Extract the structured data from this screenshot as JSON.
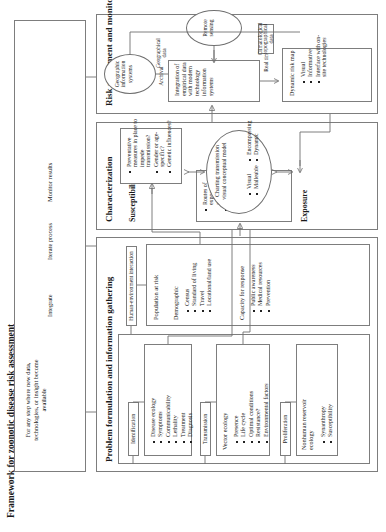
{
  "figure": {
    "title": "Framework for zoonotic disease risk assessment"
  },
  "iteration_panel": {
    "note": "For any step where new data, technologies, or insight become available",
    "steps": [
      "Integrate",
      "Iterate process",
      "Monitor results"
    ]
  },
  "phase1": {
    "title": "Problem formulation and information gathering",
    "tags": {
      "identification": "Identification",
      "transmission": "Transmission",
      "proliferation": "Proliferation",
      "human_environment": "Human-environment interaction"
    },
    "identification": {
      "items": [
        "Disease ecology",
        "Symptoms",
        "Communicability",
        "Lethality",
        "Treatment",
        "Diagnosis"
      ]
    },
    "transmission": {
      "heading": "Vector ecology",
      "items": [
        "Presence",
        "Life cycle",
        "Optimal conditions",
        "Resistance?",
        "Environmental factors"
      ]
    },
    "proliferation": {
      "heading": "Nonhuman reservoir ecology",
      "items": [
        "Synanthropy",
        "Susceptibility"
      ]
    },
    "population": {
      "heading": "Population at risk",
      "demographic": {
        "heading": "Demographic",
        "items": [
          "Census",
          "Standard of living",
          "Travel",
          "Locational/land use"
        ]
      },
      "capacity": {
        "heading": "Capacity for response",
        "items": [
          "Public awareness",
          "Medical resources",
          "Prevention"
        ]
      }
    }
  },
  "phase2": {
    "title": "Characterization",
    "exposure": {
      "title": "Exposure",
      "items": [
        "Routes of exposure (direct and indirect)",
        "Communicability",
        "Prevalence and mobility of potentially diseased parties"
      ]
    },
    "susceptibility": {
      "title": "Susceptibility",
      "items": [
        "Preventative measures in place to impede transmission?",
        "Gender or age-specific?",
        "Genetic influences?"
      ]
    },
    "model": {
      "heading": "Charting transmission visual conceptual model",
      "items_left": [
        "Visual",
        "Malleable"
      ],
      "items_right": [
        "Encompassing",
        "Dynamic"
      ]
    }
  },
  "phase3": {
    "title": "Risk assessment and monitoring",
    "integration": {
      "heading": "Integration of empirical data with modern technology information systems"
    },
    "risk_map": {
      "heading": "Dynamic risk map",
      "items": [
        "Visual",
        "Informative",
        "Interface with on-site technologies"
      ]
    },
    "gis": {
      "label": "Geographic information systems"
    },
    "remote": {
      "label": "Remote sensing"
    },
    "edges": {
      "archival": "Archival",
      "geographical_data": "Geographical data",
      "real_time": "Real time",
      "climatological": "Climatological topographical data"
    }
  }
}
